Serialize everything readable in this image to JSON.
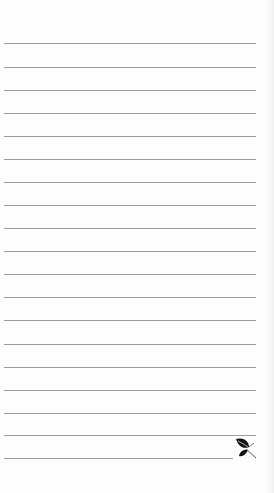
{
  "page": {
    "type": "ruled-notepad",
    "background_color": "#fdfdfd",
    "rule_color": "#9d9d9d",
    "rule_left": 4,
    "rule_right": 256,
    "rule_spacing": 23.1,
    "rules_y": [
      43,
      67,
      90,
      113,
      136,
      159,
      182,
      205,
      228,
      251,
      274,
      297,
      320,
      344,
      367,
      390,
      413,
      435,
      458
    ],
    "last_rule_right": 233
  },
  "emblem": {
    "icon": "leaf-icon",
    "color": "#111111"
  }
}
